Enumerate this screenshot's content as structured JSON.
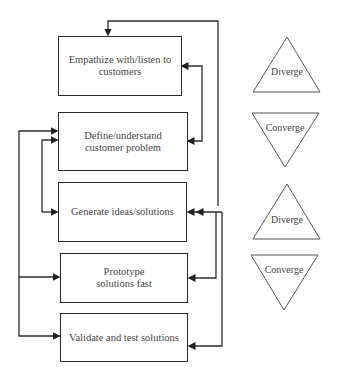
{
  "steps": [
    {
      "id": "empathize",
      "label": "Empathize with/listen to customers"
    },
    {
      "id": "define",
      "label": "Define/understand customer problem"
    },
    {
      "id": "generate",
      "label": "Generate ideas/solutions"
    },
    {
      "id": "prototype",
      "label": "Prototype solutions fast"
    },
    {
      "id": "validate",
      "label": "Validate and test solutions"
    }
  ],
  "phases": [
    {
      "label": "Diverge",
      "shape": "triangle-up"
    },
    {
      "label": "Converge",
      "shape": "triangle-down"
    },
    {
      "label": "Diverge",
      "shape": "triangle-up"
    },
    {
      "label": "Converge",
      "shape": "triangle-down"
    }
  ],
  "connections": [
    {
      "from": "define",
      "to": "empathize",
      "side": "right"
    },
    {
      "from": "empathize",
      "to": "define",
      "side": "right"
    },
    {
      "from": "generate",
      "to": "empathize",
      "side": "right-outer"
    },
    {
      "from": "generate",
      "to": "prototype",
      "side": "right"
    },
    {
      "from": "generate",
      "to": "validate",
      "side": "right-outer"
    },
    {
      "from": "generate",
      "to": "define",
      "side": "left"
    },
    {
      "from": "prototype",
      "to": "define",
      "side": "left-outer"
    },
    {
      "from": "prototype",
      "to": "validate",
      "side": "left-outer"
    }
  ]
}
